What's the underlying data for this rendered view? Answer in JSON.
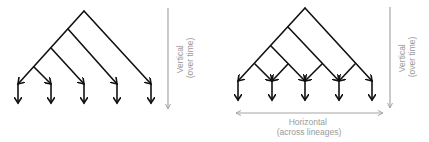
{
  "left_panel": {
    "description": "Vertical-only phylogenetic tree",
    "leaf_count": 5,
    "axis": {
      "orientation": "vertical",
      "label_line1": "Vertical",
      "label_line2": "(over time)"
    }
  },
  "right_panel": {
    "description": "Tree with vertical descent plus horizontal transfer across lineages",
    "leaf_count": 5,
    "vertical_axis": {
      "orientation": "vertical",
      "label_line1": "Vertical",
      "label_line2": "(over time)"
    },
    "horizontal_axis": {
      "orientation": "horizontal",
      "label_line1": "Horizontal",
      "label_line2": "(across lineages)"
    }
  },
  "colors": {
    "tree_line": "#111111",
    "axis_line": "#a6a6a6",
    "axis_text": "#9a9a9a"
  }
}
